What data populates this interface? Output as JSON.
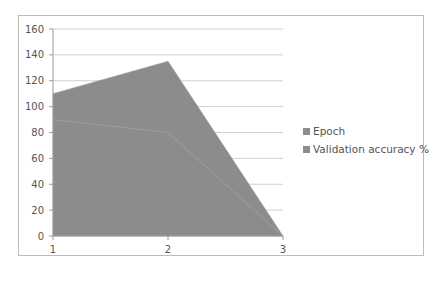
{
  "chart_data": {
    "type": "area",
    "stacked": true,
    "title": "",
    "xlabel": "",
    "ylabel": "",
    "categories": [
      "1",
      "2",
      "3"
    ],
    "series": [
      {
        "name": "Validation accuracy %",
        "values": [
          90,
          80,
          0
        ],
        "color": "#8c8c8c"
      },
      {
        "name": "Epoch",
        "values": [
          20,
          55,
          0
        ],
        "color": "#8c8c8c"
      }
    ],
    "stacked_totals": [
      110,
      135,
      0
    ],
    "ylim": [
      0,
      160
    ],
    "yticks": [
      "0",
      "20",
      "40",
      "60",
      "80",
      "100",
      "120",
      "140",
      "160"
    ],
    "grid": true,
    "legend_position": "right"
  },
  "legend": {
    "items": [
      {
        "label": "Epoch",
        "color": "#8c8c8c"
      },
      {
        "label": "Validation accuracy %",
        "color": "#8c8c8c"
      }
    ]
  }
}
